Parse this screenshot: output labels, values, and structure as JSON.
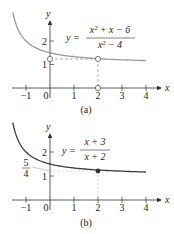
{
  "chart_data": [
    {
      "type": "line",
      "panel_label": "(a)",
      "title": "",
      "equation": {
        "lhs": "y =",
        "numerator": "x² + x − 6",
        "denominator": "x² − 4"
      },
      "xlabel": "x",
      "ylabel": "y",
      "xticks": [
        "−1",
        "0",
        "1",
        "2",
        "3",
        "4"
      ],
      "yticks": [
        "1",
        "2"
      ],
      "xlim": [
        -1.6,
        4.6
      ],
      "ylim": [
        0,
        2.8
      ],
      "curve_color": "#9a9a9a",
      "series": [
        {
          "name": "y = (x²+x−6)/(x²−4)",
          "x": [
            -1.55,
            -1.4,
            -1.2,
            -1,
            -0.5,
            0,
            0.5,
            1,
            2,
            3,
            4
          ],
          "values": [
            3.22,
            2.67,
            2.25,
            2.0,
            1.67,
            1.5,
            1.4,
            1.33,
            1.25,
            1.2,
            1.17
          ]
        }
      ],
      "annotations": [
        {
          "type": "open-circle",
          "x": 0,
          "y": 1.25
        },
        {
          "type": "open-circle",
          "x": 2,
          "y": 1.25,
          "note": "hole at x = 2"
        },
        {
          "type": "open-circle",
          "x": 2,
          "y": 0
        },
        {
          "type": "dashed-line",
          "from": [
            0,
            1.25
          ],
          "to": [
            2,
            1.25
          ]
        },
        {
          "type": "dashed-line",
          "from": [
            2,
            1.25
          ],
          "to": [
            2,
            0
          ]
        }
      ]
    },
    {
      "type": "line",
      "panel_label": "(b)",
      "title": "",
      "equation": {
        "lhs": "y =",
        "numerator": "x + 3",
        "denominator": "x + 2"
      },
      "xlabel": "x",
      "ylabel": "y",
      "xticks": [
        "−1",
        "0",
        "1",
        "2",
        "3",
        "4"
      ],
      "yticks": [
        "1",
        "2"
      ],
      "extra_ylabel": {
        "numerator": "5",
        "denominator": "4",
        "value": 1.25
      },
      "xlim": [
        -1.6,
        4.6
      ],
      "ylim": [
        0,
        2.8
      ],
      "curve_color": "#3a3a3a",
      "series": [
        {
          "name": "y = (x+3)/(x+2)",
          "x": [
            -1.55,
            -1.4,
            -1.2,
            -1,
            -0.5,
            0,
            0.5,
            1,
            2,
            3,
            4
          ],
          "values": [
            3.22,
            2.67,
            2.25,
            2.0,
            1.67,
            1.5,
            1.4,
            1.33,
            1.25,
            1.2,
            1.17
          ]
        }
      ],
      "annotations": [
        {
          "type": "filled-circle",
          "x": 2,
          "y": 1.25
        },
        {
          "type": "dashed-line",
          "from": [
            0,
            1.25
          ],
          "to": [
            2,
            1.25
          ]
        },
        {
          "type": "dashed-line",
          "from": [
            2,
            1.25
          ],
          "to": [
            2,
            0
          ]
        }
      ]
    }
  ]
}
